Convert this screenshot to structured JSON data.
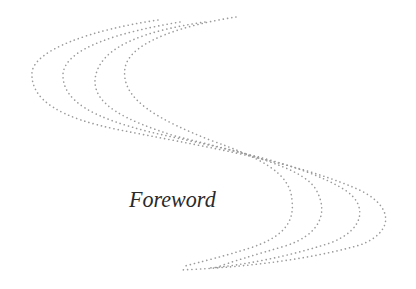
{
  "page": {
    "title": "Foreword",
    "decoration": "dotted-s-curves",
    "colors": {
      "background": "#ffffff",
      "dots": "#8a8a8a",
      "text": "#2a2a2a"
    }
  }
}
